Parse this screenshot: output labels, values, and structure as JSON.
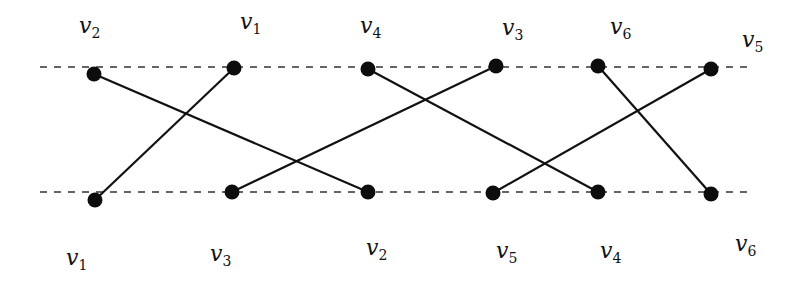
{
  "diagram": {
    "type": "bipartite-permutation-graph",
    "colors": {
      "background": "#ffffff",
      "stroke": "#111111",
      "node": "#0d0d0d",
      "dash": "#333333"
    },
    "guide_lines": [
      {
        "id": "top-line",
        "x1": 40,
        "x2": 752,
        "y": 67
      },
      {
        "id": "bottom-line",
        "x1": 40,
        "x2": 752,
        "y": 192
      }
    ],
    "top_nodes": [
      {
        "name": "v",
        "sub": "2",
        "x": 94,
        "y": 74,
        "lx": 79,
        "ly": 33
      },
      {
        "name": "v",
        "sub": "1",
        "x": 234,
        "y": 68,
        "lx": 240,
        "ly": 29
      },
      {
        "name": "v",
        "sub": "4",
        "x": 368,
        "y": 69,
        "lx": 360,
        "ly": 33
      },
      {
        "name": "v",
        "sub": "3",
        "x": 496,
        "y": 66,
        "lx": 502,
        "ly": 35
      },
      {
        "name": "v",
        "sub": "6",
        "x": 598,
        "y": 66,
        "lx": 610,
        "ly": 34
      },
      {
        "name": "v",
        "sub": "5",
        "x": 711,
        "y": 69,
        "lx": 742,
        "ly": 47
      }
    ],
    "bottom_nodes": [
      {
        "name": "v",
        "sub": "1",
        "x": 95,
        "y": 200,
        "lx": 66,
        "ly": 265
      },
      {
        "name": "v",
        "sub": "3",
        "x": 232,
        "y": 192,
        "lx": 210,
        "ly": 261
      },
      {
        "name": "v",
        "sub": "2",
        "x": 368,
        "y": 192,
        "lx": 366,
        "ly": 255
      },
      {
        "name": "v",
        "sub": "5",
        "x": 493,
        "y": 193,
        "lx": 496,
        "ly": 258
      },
      {
        "name": "v",
        "sub": "4",
        "x": 598,
        "y": 192,
        "lx": 600,
        "ly": 258
      },
      {
        "name": "v",
        "sub": "6",
        "x": 711,
        "y": 194,
        "lx": 735,
        "ly": 251
      }
    ],
    "edges": [
      {
        "from": "top:v2",
        "to": "bottom:v2"
      },
      {
        "from": "top:v1",
        "to": "bottom:v1"
      },
      {
        "from": "top:v4",
        "to": "bottom:v4"
      },
      {
        "from": "top:v3",
        "to": "bottom:v3"
      },
      {
        "from": "top:v6",
        "to": "bottom:v6"
      },
      {
        "from": "top:v5",
        "to": "bottom:v5"
      }
    ],
    "top_order": [
      "v2",
      "v1",
      "v4",
      "v3",
      "v6",
      "v5"
    ],
    "bottom_order": [
      "v1",
      "v3",
      "v2",
      "v5",
      "v4",
      "v6"
    ]
  }
}
